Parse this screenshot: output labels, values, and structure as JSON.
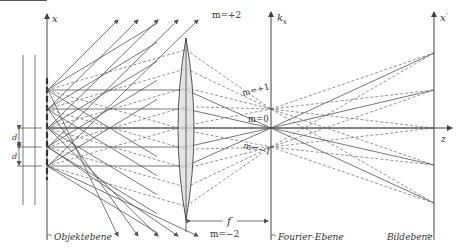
{
  "figure": {
    "colors": {
      "stroke": "#555555",
      "lens_fill": "#dcdcdc",
      "background": "#ffffff"
    }
  },
  "axes": {
    "object_axis_label": "x",
    "fourier_axis_label": "k_x",
    "fourier_axis_main": "k",
    "fourier_axis_sub": "x",
    "image_axis_main": "x",
    "image_axis_prime": "′",
    "optical_axis_label": "z"
  },
  "orders": {
    "m_plus2": "m=+2",
    "m_plus1": "m=+1",
    "m_0": "m=0",
    "m_minus1": "m=−1",
    "m_minus2": "m=−2"
  },
  "dimensions": {
    "slit_spacing": "d",
    "focal_length": "f"
  },
  "planes": {
    "object": "Objektebene",
    "fourier": "Fourier-Ebene",
    "image": "Bildebene"
  },
  "geometry": {
    "object_plane_x": 47,
    "lens_x": 186,
    "lens_top": 38,
    "lens_bottom": 220,
    "fourier_plane_x": 271,
    "image_plane_x": 434,
    "optical_axis_y": 128,
    "slit_y": [
      90,
      109,
      128,
      147,
      166
    ],
    "fourier_points_y": [
      109,
      128,
      147
    ],
    "image_points_y": [
      203,
      165,
      128,
      90,
      53
    ]
  }
}
